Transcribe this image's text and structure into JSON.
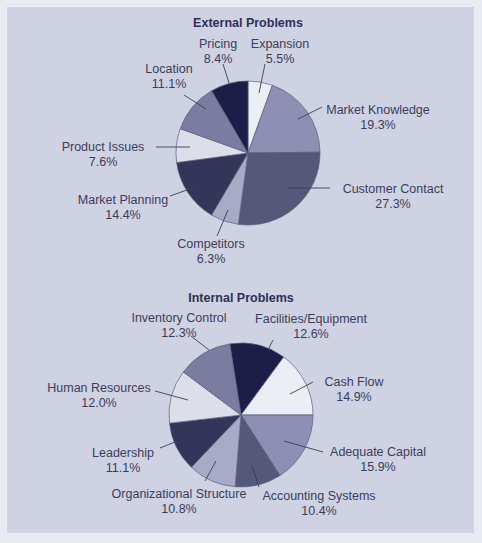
{
  "chart_data": [
    {
      "type": "pie",
      "title": "External Problems",
      "start_angle_deg": 0,
      "direction": "clockwise",
      "slices": [
        {
          "label": "Expansion",
          "value": 5.5,
          "display": "5.5%",
          "color": "#eceef6"
        },
        {
          "label": "Market Knowledge",
          "value": 19.3,
          "display": "19.3%",
          "color": "#8d90b2"
        },
        {
          "label": "Customer Contact",
          "value": 27.3,
          "display": "27.3%",
          "color": "#555878"
        },
        {
          "label": "Competitors",
          "value": 6.3,
          "display": "6.3%",
          "color": "#a8abc6"
        },
        {
          "label": "Market Planning",
          "value": 14.4,
          "display": "14.4%",
          "color": "#333659"
        },
        {
          "label": "Product Issues",
          "value": 7.6,
          "display": "7.6%",
          "color": "#dcdeea"
        },
        {
          "label": "Location",
          "value": 11.1,
          "display": "11.1%",
          "color": "#7a7d9f"
        },
        {
          "label": "Pricing",
          "value": 8.4,
          "display": "8.4%",
          "color": "#1c1e48"
        }
      ]
    },
    {
      "type": "pie",
      "title": "Internal Problems",
      "start_angle_deg": -9,
      "direction": "clockwise",
      "slices": [
        {
          "label": "Facilities/Equipment",
          "value": 12.6,
          "display": "12.6%",
          "color": "#1c1e48"
        },
        {
          "label": "Cash Flow",
          "value": 14.9,
          "display": "14.9%",
          "color": "#eceef6"
        },
        {
          "label": "Adequate Capital",
          "value": 15.9,
          "display": "15.9%",
          "color": "#8d90b2"
        },
        {
          "label": "Accounting Systems",
          "value": 10.4,
          "display": "10.4%",
          "color": "#555878"
        },
        {
          "label": "Organizational Structure",
          "value": 10.8,
          "display": "10.8%",
          "color": "#a8abc6"
        },
        {
          "label": "Leadership",
          "value": 11.1,
          "display": "11.1%",
          "color": "#333659"
        },
        {
          "label": "Human Resources",
          "value": 12.0,
          "display": "12.0%",
          "color": "#dcdeea"
        },
        {
          "label": "Inventory Control",
          "value": 12.3,
          "display": "12.3%",
          "color": "#7a7d9f"
        }
      ]
    }
  ]
}
